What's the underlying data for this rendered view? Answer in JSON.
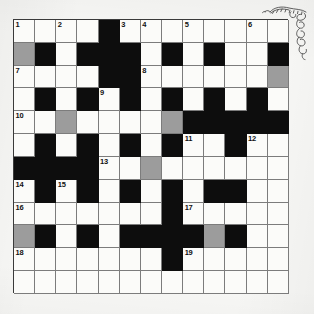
{
  "puzzle": {
    "type": "crossword-grid",
    "columns": 13,
    "rows": 12,
    "colors": {
      "white_cell": "#fbfbf9",
      "block_cell": "#0d0d0d",
      "shaded_cell": "#9c9c9c",
      "grid_line": "#7c7c7c",
      "border": "#3a3a3a",
      "number_text": "#111111",
      "page_background": "#f7f7f5"
    },
    "legend": {
      "white": "empty answer square",
      "black": "blocked square",
      "gray": "shaded / highlighted answer square"
    },
    "clue_numbers_present": [
      "1",
      "2",
      "3",
      "4",
      "5",
      "6",
      "7",
      "8",
      "9",
      "10",
      "11",
      "12",
      "13",
      "14",
      "15",
      "16",
      "17",
      "18",
      "19"
    ],
    "cells": [
      [
        {
          "s": "white",
          "n": "1"
        },
        {
          "s": "white",
          "n": ""
        },
        {
          "s": "white",
          "n": "2"
        },
        {
          "s": "white",
          "n": ""
        },
        {
          "s": "black",
          "n": ""
        },
        {
          "s": "white",
          "n": "3"
        },
        {
          "s": "white",
          "n": "4"
        },
        {
          "s": "white",
          "n": ""
        },
        {
          "s": "white",
          "n": "5"
        },
        {
          "s": "white",
          "n": ""
        },
        {
          "s": "white",
          "n": ""
        },
        {
          "s": "white",
          "n": "6"
        },
        {
          "s": "white",
          "n": ""
        }
      ],
      [
        {
          "s": "gray",
          "n": ""
        },
        {
          "s": "black",
          "n": ""
        },
        {
          "s": "white",
          "n": ""
        },
        {
          "s": "black",
          "n": ""
        },
        {
          "s": "black",
          "n": ""
        },
        {
          "s": "black",
          "n": ""
        },
        {
          "s": "white",
          "n": ""
        },
        {
          "s": "black",
          "n": ""
        },
        {
          "s": "white",
          "n": ""
        },
        {
          "s": "black",
          "n": ""
        },
        {
          "s": "white",
          "n": ""
        },
        {
          "s": "white",
          "n": ""
        },
        {
          "s": "black",
          "n": ""
        }
      ],
      [
        {
          "s": "white",
          "n": "7"
        },
        {
          "s": "white",
          "n": ""
        },
        {
          "s": "white",
          "n": ""
        },
        {
          "s": "white",
          "n": ""
        },
        {
          "s": "black",
          "n": ""
        },
        {
          "s": "black",
          "n": ""
        },
        {
          "s": "white",
          "n": "8"
        },
        {
          "s": "white",
          "n": ""
        },
        {
          "s": "white",
          "n": ""
        },
        {
          "s": "white",
          "n": ""
        },
        {
          "s": "white",
          "n": ""
        },
        {
          "s": "white",
          "n": ""
        },
        {
          "s": "gray",
          "n": ""
        }
      ],
      [
        {
          "s": "white",
          "n": ""
        },
        {
          "s": "black",
          "n": ""
        },
        {
          "s": "white",
          "n": ""
        },
        {
          "s": "black",
          "n": ""
        },
        {
          "s": "white",
          "n": "9"
        },
        {
          "s": "black",
          "n": ""
        },
        {
          "s": "white",
          "n": ""
        },
        {
          "s": "black",
          "n": ""
        },
        {
          "s": "white",
          "n": ""
        },
        {
          "s": "black",
          "n": ""
        },
        {
          "s": "white",
          "n": ""
        },
        {
          "s": "black",
          "n": ""
        },
        {
          "s": "white",
          "n": ""
        }
      ],
      [
        {
          "s": "white",
          "n": "10"
        },
        {
          "s": "white",
          "n": ""
        },
        {
          "s": "gray",
          "n": ""
        },
        {
          "s": "white",
          "n": ""
        },
        {
          "s": "white",
          "n": ""
        },
        {
          "s": "white",
          "n": ""
        },
        {
          "s": "white",
          "n": ""
        },
        {
          "s": "gray",
          "n": ""
        },
        {
          "s": "black",
          "n": ""
        },
        {
          "s": "black",
          "n": ""
        },
        {
          "s": "black",
          "n": ""
        },
        {
          "s": "black",
          "n": ""
        },
        {
          "s": "black",
          "n": ""
        }
      ],
      [
        {
          "s": "white",
          "n": ""
        },
        {
          "s": "black",
          "n": ""
        },
        {
          "s": "white",
          "n": ""
        },
        {
          "s": "black",
          "n": ""
        },
        {
          "s": "white",
          "n": ""
        },
        {
          "s": "black",
          "n": ""
        },
        {
          "s": "white",
          "n": ""
        },
        {
          "s": "black",
          "n": ""
        },
        {
          "s": "white",
          "n": "11"
        },
        {
          "s": "white",
          "n": ""
        },
        {
          "s": "black",
          "n": ""
        },
        {
          "s": "white",
          "n": "12"
        },
        {
          "s": "white",
          "n": ""
        }
      ],
      [
        {
          "s": "black",
          "n": ""
        },
        {
          "s": "black",
          "n": ""
        },
        {
          "s": "black",
          "n": ""
        },
        {
          "s": "black",
          "n": ""
        },
        {
          "s": "white",
          "n": "13"
        },
        {
          "s": "white",
          "n": ""
        },
        {
          "s": "gray",
          "n": ""
        },
        {
          "s": "white",
          "n": ""
        },
        {
          "s": "white",
          "n": ""
        },
        {
          "s": "white",
          "n": ""
        },
        {
          "s": "white",
          "n": ""
        },
        {
          "s": "white",
          "n": ""
        },
        {
          "s": "white",
          "n": ""
        }
      ],
      [
        {
          "s": "white",
          "n": "14"
        },
        {
          "s": "black",
          "n": ""
        },
        {
          "s": "white",
          "n": "15"
        },
        {
          "s": "black",
          "n": ""
        },
        {
          "s": "white",
          "n": ""
        },
        {
          "s": "black",
          "n": ""
        },
        {
          "s": "white",
          "n": ""
        },
        {
          "s": "black",
          "n": ""
        },
        {
          "s": "white",
          "n": ""
        },
        {
          "s": "black",
          "n": ""
        },
        {
          "s": "black",
          "n": ""
        },
        {
          "s": "white",
          "n": ""
        },
        {
          "s": "white",
          "n": ""
        }
      ],
      [
        {
          "s": "white",
          "n": "16"
        },
        {
          "s": "white",
          "n": ""
        },
        {
          "s": "white",
          "n": ""
        },
        {
          "s": "white",
          "n": ""
        },
        {
          "s": "white",
          "n": ""
        },
        {
          "s": "white",
          "n": ""
        },
        {
          "s": "white",
          "n": ""
        },
        {
          "s": "black",
          "n": ""
        },
        {
          "s": "white",
          "n": "17"
        },
        {
          "s": "white",
          "n": ""
        },
        {
          "s": "white",
          "n": ""
        },
        {
          "s": "white",
          "n": ""
        },
        {
          "s": "white",
          "n": ""
        }
      ],
      [
        {
          "s": "gray",
          "n": ""
        },
        {
          "s": "black",
          "n": ""
        },
        {
          "s": "white",
          "n": ""
        },
        {
          "s": "black",
          "n": ""
        },
        {
          "s": "white",
          "n": ""
        },
        {
          "s": "black",
          "n": ""
        },
        {
          "s": "black",
          "n": ""
        },
        {
          "s": "black",
          "n": ""
        },
        {
          "s": "black",
          "n": ""
        },
        {
          "s": "gray",
          "n": ""
        },
        {
          "s": "black",
          "n": ""
        },
        {
          "s": "white",
          "n": ""
        },
        {
          "s": "white",
          "n": ""
        }
      ],
      [
        {
          "s": "white",
          "n": "18"
        },
        {
          "s": "white",
          "n": ""
        },
        {
          "s": "white",
          "n": ""
        },
        {
          "s": "white",
          "n": ""
        },
        {
          "s": "white",
          "n": ""
        },
        {
          "s": "white",
          "n": ""
        },
        {
          "s": "white",
          "n": ""
        },
        {
          "s": "black",
          "n": ""
        },
        {
          "s": "white",
          "n": "19"
        },
        {
          "s": "white",
          "n": ""
        },
        {
          "s": "white",
          "n": ""
        },
        {
          "s": "white",
          "n": ""
        },
        {
          "s": "white",
          "n": ""
        }
      ],
      [
        {
          "s": "white",
          "n": ""
        },
        {
          "s": "white",
          "n": ""
        },
        {
          "s": "white",
          "n": ""
        },
        {
          "s": "white",
          "n": ""
        },
        {
          "s": "white",
          "n": ""
        },
        {
          "s": "white",
          "n": ""
        },
        {
          "s": "white",
          "n": ""
        },
        {
          "s": "white",
          "n": ""
        },
        {
          "s": "white",
          "n": ""
        },
        {
          "s": "white",
          "n": ""
        },
        {
          "s": "white",
          "n": ""
        },
        {
          "s": "white",
          "n": ""
        },
        {
          "s": "white",
          "n": ""
        }
      ]
    ]
  },
  "annotation": {
    "doodle": "handwritten-scribble-doodle",
    "doodle_position": "top-right-corner"
  }
}
